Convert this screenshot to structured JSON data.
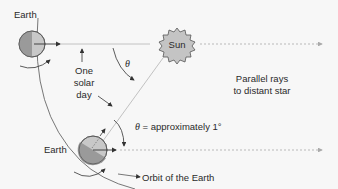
{
  "diagram": {
    "labels": {
      "earth_top": "Earth",
      "sun": "Sun",
      "theta": "θ",
      "solar_day_1": "One",
      "solar_day_2": "solar",
      "solar_day_3": "day",
      "parallel_1": "Parallel rays",
      "parallel_2": "to distant star",
      "earth_bottom": "Earth",
      "theta_eq": "θ",
      "approx": " = approximately 1°",
      "orbit": "Orbit of the Earth"
    },
    "colors": {
      "background": "#f7f7f7",
      "earth_light": "#c8c8c8",
      "earth_dark": "#9a9a9a",
      "sun_fill": "#c4c4c4",
      "line": "#333333",
      "ray": "#b0b0b0"
    }
  }
}
